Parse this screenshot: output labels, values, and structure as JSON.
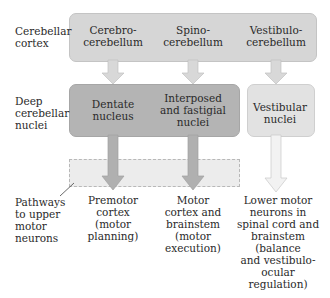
{
  "colors": {
    "cortex_box": "#d6d6d6",
    "deep_nuclei_box": "#b4b4b4",
    "vestibular_box": "#e2e2e2",
    "dashed_region": "#ececec",
    "arrow_light": "#d8d8d8",
    "arrow_dark": "#b0b0b0",
    "arrow_white": "#f2f2f2"
  },
  "row_labels": {
    "cerebellar_cortex": [
      "Cerebellar",
      "cortex"
    ],
    "deep_nuclei": [
      "Deep",
      "cerebellar",
      "nuclei"
    ],
    "pathways": [
      "Pathways",
      "to upper",
      "motor",
      "neurons"
    ]
  },
  "cortex": {
    "cerebro": [
      "Cerebro-",
      "cerebellum"
    ],
    "spino": [
      "Spino-",
      "cerebellum"
    ],
    "vestibulo": [
      "Vestibulo-",
      "cerebellum"
    ]
  },
  "nuclei": {
    "dentate": [
      "Dentate",
      "nucleus"
    ],
    "interposed": [
      "Interposed",
      "and fastigial",
      "nuclei"
    ],
    "vestibular": [
      "Vestibular",
      "nuclei"
    ]
  },
  "targets": {
    "premotor": [
      "Premotor",
      "cortex",
      "(motor",
      "planning)"
    ],
    "motor": [
      "Motor",
      "cortex and",
      "brainstem",
      "(motor",
      "execution)"
    ],
    "lower": [
      "Lower motor",
      "neurons in",
      "spinal cord and",
      "brainstem",
      "(balance",
      "and vestibulo-",
      "ocular",
      "regulation)"
    ]
  }
}
